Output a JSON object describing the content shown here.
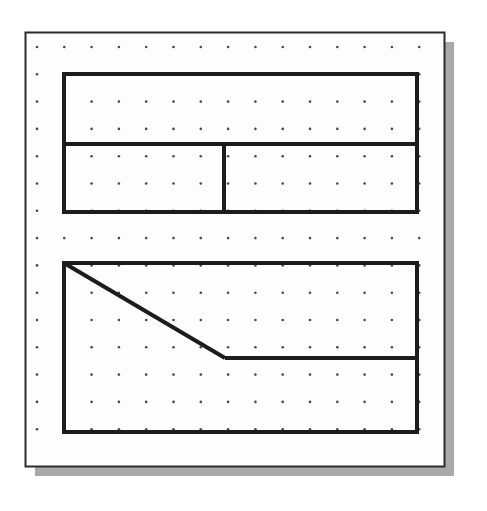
{
  "figure": {
    "background_color": "#ffffff",
    "paper_color": "#fdfdfd",
    "border_color": "#2b2b2b",
    "shadow_color": "#9a9a9a",
    "dot_color": "#4a4a4a",
    "stroke_color": "#1c1c1c"
  },
  "chart_data": {
    "type": "diagram",
    "xlabel": "",
    "ylabel": "",
    "grid": true,
    "legend": "none",
    "canvas": {
      "width": 487,
      "height": 511
    },
    "paper": {
      "name": "paper-sheet",
      "x": 25,
      "y": 32,
      "width": 419,
      "height": 434,
      "border_width": 2,
      "shadow_offset_x": 10,
      "shadow_offset_y": 10
    },
    "dot_grid": {
      "name": "dot-grid",
      "origin_x": 37,
      "origin_y": 47,
      "spacing_x": 27.3,
      "spacing_y": 27.3,
      "columns": 15,
      "rows": 15,
      "dot_radius": 1.3
    },
    "shapes": [
      {
        "name": "upper-composite-shape",
        "stroke_width": 4,
        "outline": [
          [
            64,
            74
          ],
          [
            417,
            74
          ],
          [
            417,
            212
          ],
          [
            64,
            212
          ]
        ],
        "interior_lines": [
          {
            "name": "upper-horizontal-divider",
            "points": [
              [
                64,
                144
              ],
              [
                417,
                144
              ]
            ]
          },
          {
            "name": "upper-vertical-divider",
            "points": [
              [
                224,
                144
              ],
              [
                224,
                212
              ]
            ]
          }
        ]
      },
      {
        "name": "lower-composite-shape",
        "stroke_width": 4,
        "outline": [
          [
            64,
            263
          ],
          [
            417,
            263
          ],
          [
            417,
            432
          ],
          [
            64,
            432
          ]
        ],
        "interior_lines": [
          {
            "name": "lower-diagonal-line",
            "points": [
              [
                64,
                263
              ],
              [
                225,
                358
              ]
            ]
          },
          {
            "name": "lower-horizontal-line",
            "points": [
              [
                225,
                358
              ],
              [
                417,
                358
              ]
            ]
          }
        ]
      }
    ]
  }
}
